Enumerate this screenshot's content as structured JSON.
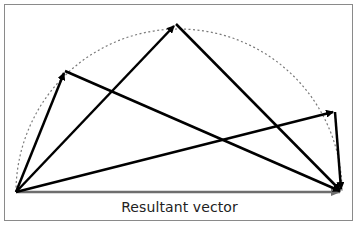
{
  "diagram": {
    "label": "Resultant vector",
    "colors": {
      "frame": "#8a8a8a",
      "vectors": "#000000",
      "resultant": "#6e6e6e",
      "arc": "#7a7a7a"
    },
    "origin": [
      16,
      192
    ],
    "resultant_end": [
      342,
      192
    ],
    "tips": [
      [
        65,
        71
      ],
      [
        176,
        24
      ],
      [
        335,
        112
      ]
    ],
    "arc": {
      "center": [
        179,
        192
      ],
      "radius": 163,
      "style": "dotted"
    }
  }
}
